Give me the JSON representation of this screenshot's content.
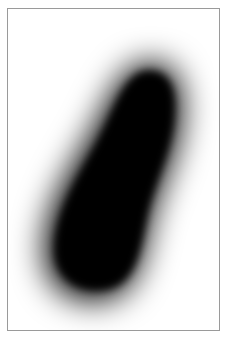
{
  "image": {
    "description": "Blurred black blob (elongated, slanted capsule shape) on white background within a thin gray frame",
    "colors": {
      "background": "#ffffff",
      "frame_border": "#9a9a9a",
      "blob": "#000000"
    }
  }
}
